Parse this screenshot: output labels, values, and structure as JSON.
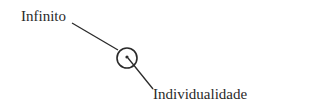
{
  "diagram": {
    "labels": {
      "top": "Infinito",
      "bottom": "Individualidade"
    },
    "colors": {
      "stroke": "#2a2a2a",
      "text": "#2a2a2a",
      "background": "#ffffff"
    }
  }
}
